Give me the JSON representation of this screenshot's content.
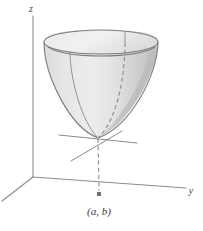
{
  "figure": {
    "kind": "3d-paraboloid-diagram",
    "background_color": "#ffffff",
    "labels": {
      "z_axis": "z",
      "y_axis": "y",
      "point": "(a, b)"
    },
    "colors": {
      "surface_light": "#e3e3e3",
      "surface_mid": "#d2d2d2",
      "surface_dark": "#bdbdbd",
      "rim_top": "#ededed",
      "outline": "#7c7c7c",
      "axis": "#8c8c8c",
      "dash": "#8a8a8a",
      "marker": "#6e6e6e",
      "label_text": "#3d3d3d"
    },
    "geometry": {
      "origin": {
        "x": 33,
        "y": 177
      },
      "z_axis_top": {
        "x": 33,
        "y": 16
      },
      "y_axis_end": {
        "x": 186,
        "y": 188
      },
      "x_axis_end": {
        "x": 2,
        "y": 201
      },
      "vertex": {
        "x": 98,
        "y": 138
      },
      "point_marker": {
        "x": 99,
        "y": 194
      },
      "rim_center": {
        "x": 101,
        "y": 42
      },
      "rim_rx": 57,
      "rim_ry": 12
    }
  }
}
